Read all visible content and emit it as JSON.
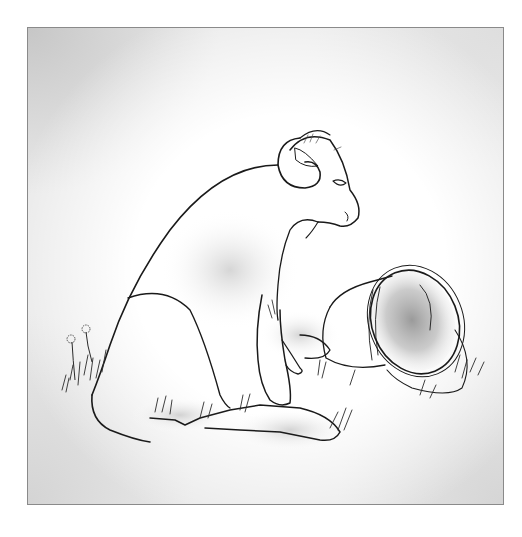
{
  "illustration": {
    "subject": "ram sitting beside an overturned bucket in grass",
    "style": "black ink line drawing with gray watercolor shading",
    "colors": {
      "ink": "#1a1a1a",
      "shade": "#9a9a9a",
      "frame_border": "#8a8a8a",
      "background": "#ffffff"
    },
    "elements": [
      "ram",
      "curled-horn",
      "bucket",
      "bucket-handle",
      "grass-tufts",
      "dandelions"
    ]
  }
}
